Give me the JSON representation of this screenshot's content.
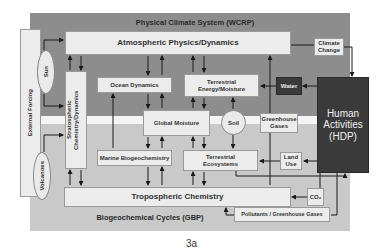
{
  "figure_label": "3a",
  "regions": {
    "physical_title": "Physical Climate System (WCRP)",
    "biogeo_title": "Biogeochemical Cycles (GBP)"
  },
  "external": {
    "label": "External Forcing",
    "sun": "Sun",
    "volcanoes": "Volcanoes"
  },
  "boxes": {
    "atmospheric": "Atmospheric Physics/Dynamics",
    "stratospheric": "Stratospheric Chemistry/Dynamics",
    "ocean": "Ocean Dynamics",
    "terrestrial_energy": "Terrestrial Energy/Moisture",
    "water": "Water",
    "climate_change": "Climate Change",
    "human": "Human Activities (HDP)",
    "global_moisture": "Global Moisture",
    "soil": "Soil",
    "greenhouse": "Greenhouse Gases",
    "marine": "Marine Biogeochemistry",
    "terrestrial_eco": "Terrestrial Ecosystems",
    "land_use": "Land Use",
    "tropospheric": "Tropospheric Chemistry",
    "co2": "CO₂",
    "pollutants": "Pollutants / Greenhouse Gases"
  },
  "colors": {
    "top_region": "#8d8d8d",
    "bottom_region": "#c9c9c9",
    "dark_box": "#3a3a3a",
    "box": "#ececec"
  }
}
